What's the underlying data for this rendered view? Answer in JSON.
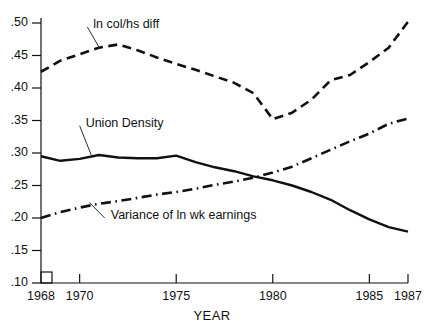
{
  "chart_data": {
    "type": "line",
    "title": "",
    "xlabel": "YEAR",
    "ylabel": "",
    "xlim": [
      1968,
      1987
    ],
    "ylim": [
      0.1,
      0.5
    ],
    "grid": false,
    "legend_position": "inline-annotations",
    "xticks": [
      1968,
      1970,
      1975,
      1980,
      1985,
      1987
    ],
    "xtick_labels": [
      "1968",
      "1970",
      "1975",
      "1980",
      "1985",
      "1987"
    ],
    "yticks": [
      0.1,
      0.15,
      0.2,
      0.25,
      0.3,
      0.35,
      0.4,
      0.45,
      0.5
    ],
    "ytick_labels": [
      ".10",
      ".15",
      ".20",
      ".25",
      ".30",
      ".35",
      ".40",
      ".45",
      ".50"
    ],
    "x": [
      1968,
      1969,
      1970,
      1971,
      1972,
      1973,
      1974,
      1975,
      1976,
      1977,
      1978,
      1979,
      1980,
      1981,
      1982,
      1983,
      1984,
      1985,
      1986,
      1987
    ],
    "series": [
      {
        "name": "ln col/hs diff",
        "style": "dashed",
        "color": "#111111",
        "values": [
          0.425,
          0.442,
          0.452,
          0.462,
          0.467,
          0.458,
          0.447,
          0.437,
          0.428,
          0.418,
          0.408,
          0.392,
          0.352,
          0.362,
          0.382,
          0.412,
          0.42,
          0.44,
          0.462,
          0.502
        ]
      },
      {
        "name": "Union Density",
        "style": "solid",
        "color": "#111111",
        "values": [
          0.295,
          0.288,
          0.291,
          0.297,
          0.293,
          0.292,
          0.292,
          0.296,
          0.286,
          0.278,
          0.272,
          0.264,
          0.258,
          0.25,
          0.24,
          0.228,
          0.212,
          0.198,
          0.186,
          0.179
        ]
      },
      {
        "name": "Variance of ln wk earnings",
        "style": "dashdot",
        "color": "#111111",
        "values": [
          0.2,
          0.209,
          0.216,
          0.222,
          0.226,
          0.231,
          0.236,
          0.24,
          0.245,
          0.251,
          0.256,
          0.262,
          0.27,
          0.279,
          0.292,
          0.305,
          0.318,
          0.33,
          0.345,
          0.353
        ]
      }
    ],
    "annotations": [
      {
        "label": "ln col/hs diff",
        "x": 1970.4,
        "y": 0.497,
        "leader_to_x": 1971.0,
        "leader_to_y": 0.463
      },
      {
        "label": "Union Density",
        "x": 1970.0,
        "y": 0.345,
        "leader_to_x": 1970.6,
        "leader_to_y": 0.297
      },
      {
        "label": "Variance of ln wk earnings",
        "x": 1971.3,
        "y": 0.203,
        "leader_to_x": 1970.5,
        "leader_to_y": 0.224
      }
    ]
  }
}
